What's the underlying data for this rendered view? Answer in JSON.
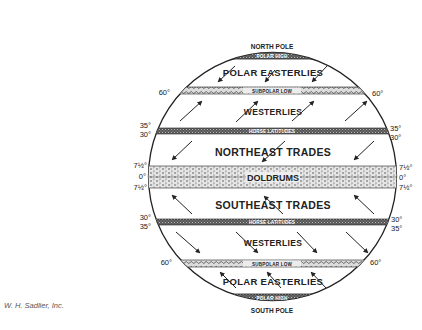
{
  "credit": "W. H. Sadlier, Inc.",
  "poles": {
    "north": "NORTH POLE",
    "south": "SOUTH POLE"
  },
  "bands": {
    "polar_high_n": "POLAR HIGH",
    "subpolar_low_n": "SUBPOLAR LOW",
    "horse_latitudes_n": "HORSE LATITUDES",
    "doldrums": "DOLDRUMS",
    "horse_latitudes_s": "HORSE LATITUDES",
    "subpolar_low_s": "SUBPOLAR LOW",
    "polar_high_s": "POLAR HIGH"
  },
  "winds": {
    "polar_easterlies_n": "POLAR EASTERLIES",
    "westerlies_n": "WESTERLIES",
    "northeast_trades": "NORTHEAST TRADES",
    "southeast_trades": "SOUTHEAST TRADES",
    "westerlies_s": "WESTERLIES",
    "polar_easterlies_s": "POLAR EASTERLIES"
  },
  "latitudes": {
    "n60": "60°",
    "n35": "35°",
    "n30": "30°",
    "n7": "7½°",
    "eq": "0°",
    "s7": "7½°",
    "s30": "30°",
    "s35": "35°",
    "s60": "60°"
  }
}
